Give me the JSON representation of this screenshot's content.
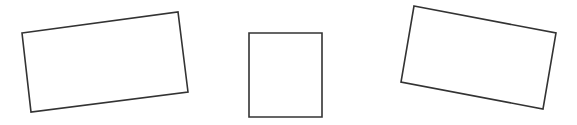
{
  "scene": {
    "title": "Quadrilateral outlines",
    "background_color": "#ffffff",
    "width": 577,
    "height": 125,
    "stroke_color": "#333333",
    "fill_color": "#ffffff",
    "stroke_width": 1.6,
    "shape_count": 3
  },
  "shapes": [
    {
      "id": "shape-1",
      "name": "left-rotated-rectangle",
      "kind": "rectangle",
      "orientation": "rotated",
      "rotation_degrees": -8.5,
      "points": "22,33 178,12 188,92 31,112",
      "corners": [
        {
          "label": "top-left",
          "x": 22,
          "y": 33
        },
        {
          "label": "top-right",
          "x": 178,
          "y": 12
        },
        {
          "label": "bottom-right",
          "x": 188,
          "y": 92
        },
        {
          "label": "bottom-left",
          "x": 31,
          "y": 112
        }
      ]
    },
    {
      "id": "shape-2",
      "name": "center-upright-square",
      "kind": "square",
      "orientation": "axis-aligned",
      "rotation_degrees": 0,
      "points": "249,33 322,33 322,117 249,117",
      "corners": [
        {
          "label": "top-left",
          "x": 249,
          "y": 33
        },
        {
          "label": "top-right",
          "x": 322,
          "y": 33
        },
        {
          "label": "bottom-right",
          "x": 322,
          "y": 117
        },
        {
          "label": "bottom-left",
          "x": 249,
          "y": 117
        }
      ]
    },
    {
      "id": "shape-3",
      "name": "right-rotated-rectangle",
      "kind": "rectangle",
      "orientation": "rotated",
      "rotation_degrees": 11.0,
      "points": "414,6 556,33 543,109 401,82",
      "corners": [
        {
          "label": "top-left",
          "x": 414,
          "y": 6
        },
        {
          "label": "top-right",
          "x": 556,
          "y": 33
        },
        {
          "label": "bottom-right",
          "x": 543,
          "y": 109
        },
        {
          "label": "bottom-left",
          "x": 401,
          "y": 82
        }
      ]
    }
  ]
}
